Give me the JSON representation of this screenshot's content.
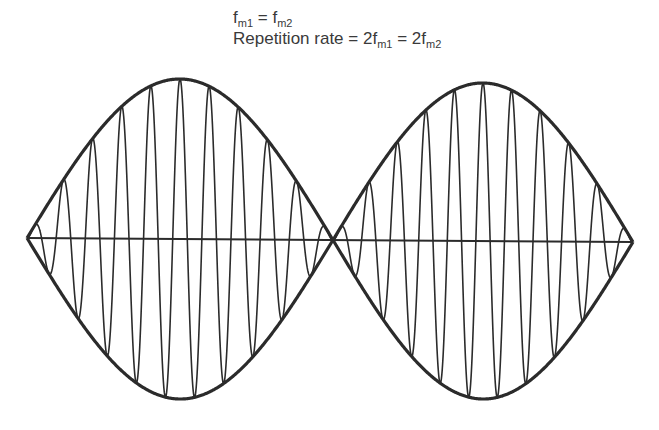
{
  "caption": {
    "line1": {
      "f1": "f",
      "s1": "m1",
      "eq": " = ",
      "f2": "f",
      "s2": "m2"
    },
    "line2": {
      "label": "Repetition rate = 2f",
      "s1": "m1",
      "eq": " = 2f",
      "s2": "m2"
    }
  },
  "chart_data": {
    "type": "line",
    "axis": {
      "x_start": 27,
      "y_start": 238,
      "x_end": 633,
      "y_end": 242
    },
    "lobes": [
      {
        "x_start": 27,
        "x_end": 333,
        "amplitude_px": 160,
        "carrier_cycles": 10.5
      },
      {
        "x_start": 333,
        "x_end": 633,
        "amplitude_px": 158,
        "carrier_cycles": 10.5
      }
    ],
    "envelope_stroke": "#2b2b2b",
    "carrier_stroke": "#2b2b2b",
    "axis_stroke": "#2b2b2b",
    "grid": false,
    "legend": false
  }
}
